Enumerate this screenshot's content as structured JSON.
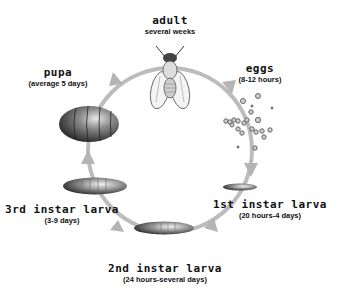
{
  "diagram": {
    "type": "life-cycle",
    "ring_color": "#bcbcbc",
    "stages": [
      {
        "id": "adult",
        "name": "adult",
        "duration": "several weeks"
      },
      {
        "id": "eggs",
        "name": "eggs",
        "duration": "(8-12 hours)"
      },
      {
        "id": "first-instar",
        "name": "1st instar larva",
        "duration": "(20 hours-4 days)"
      },
      {
        "id": "second-instar",
        "name": "2nd instar larva",
        "duration": "(24 hours-several days)"
      },
      {
        "id": "third-instar",
        "name": "3rd instar larva",
        "duration": "(3-9 days)"
      },
      {
        "id": "pupa",
        "name": "pupa",
        "duration": "(average 5 days)"
      }
    ],
    "icons": {
      "adult": "fly-icon",
      "eggs": "eggs-cluster-icon",
      "first-instar": "larva-icon",
      "second-instar": "larva-icon",
      "third-instar": "larva-icon",
      "pupa": "pupa-icon"
    }
  }
}
